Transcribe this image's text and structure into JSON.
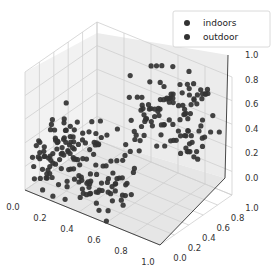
{
  "chart_data": {
    "type": "scatter",
    "projection": "3d",
    "title": "",
    "xlabel": "",
    "ylabel": "",
    "zlabel": "",
    "xlim": [
      0,
      1
    ],
    "ylim": [
      0,
      1
    ],
    "zlim": [
      0,
      1
    ],
    "x_ticks": [
      "0.0",
      "0.2",
      "0.4",
      "0.6",
      "0.8",
      "1.0"
    ],
    "y_ticks": [
      "0.0",
      "0.2",
      "0.4",
      "0.6",
      "0.8",
      "1.0"
    ],
    "z_ticks": [
      "0.0",
      "0.2",
      "0.4",
      "0.6",
      "0.8",
      "1.0"
    ],
    "grid": true,
    "legend_position": "upper right",
    "series": [
      {
        "name": "indoors",
        "color": "#333333",
        "marker": "o",
        "count_estimate": 150
      },
      {
        "name": "outdoor",
        "color": "#333333",
        "marker": "o",
        "count_estimate": 150
      }
    ]
  },
  "legend": {
    "items": [
      {
        "label": "indoors",
        "color": "#333333"
      },
      {
        "label": "outdoor",
        "color": "#333333"
      }
    ]
  },
  "axes": {
    "x_tick_labels": [
      "0.0",
      "0.2",
      "0.4",
      "0.6",
      "0.8",
      "1.0"
    ],
    "y_tick_labels": [
      "0.0",
      "0.2",
      "0.4",
      "0.6",
      "0.8",
      "1.0"
    ],
    "z_tick_labels": [
      "0.0",
      "0.2",
      "0.4",
      "0.6",
      "0.8",
      "1.0"
    ]
  }
}
